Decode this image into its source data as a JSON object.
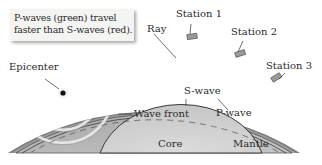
{
  "callout": {
    "line1": "P-waves (green) travel",
    "line2": "faster than S-waves (red)."
  },
  "labels": {
    "epicenter": "Epicenter",
    "ray": "Ray",
    "station1": "Station 1",
    "station2": "Station 2",
    "station3": "Station 3",
    "s_wave": "S-wave",
    "p_wave": "P-wave",
    "wave_front": "Wave front",
    "core": "Core",
    "mantle": "Mantle"
  },
  "colors": {
    "crust": "#8a8a8a",
    "mantle": "#b9b9b9",
    "core": "#d2d2d2",
    "p_wave": "#6f6f6f",
    "s_wave": "#7d7d7d",
    "wave_front": "#e6e6e6"
  }
}
